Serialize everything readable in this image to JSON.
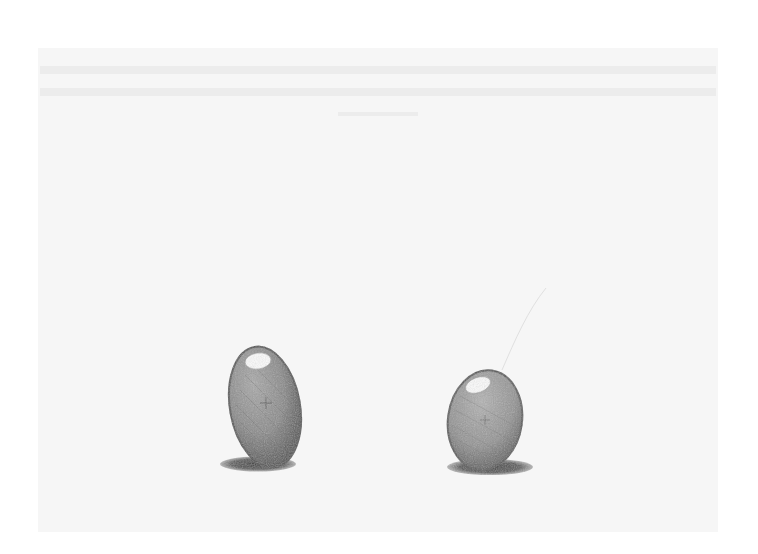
{
  "image": {
    "kind": "pencil drawing scan",
    "subject": "two egg-shaped objects with cast shadows",
    "objects": [
      {
        "name": "left-egg",
        "shape": "tall ellipse, tilted slightly left",
        "has_highlight": true,
        "has_shadow": true
      },
      {
        "name": "right-egg",
        "shape": "rounder ellipse",
        "has_highlight": true,
        "has_shadow": true
      }
    ],
    "colors": {
      "background": "#ffffff",
      "paper": "#f6f6f6",
      "pencil_dark": "#3a3a3a",
      "pencil_mid": "#7a7a7a",
      "pencil_light": "#a8a8a8",
      "highlight": "#fbfbfb"
    }
  }
}
